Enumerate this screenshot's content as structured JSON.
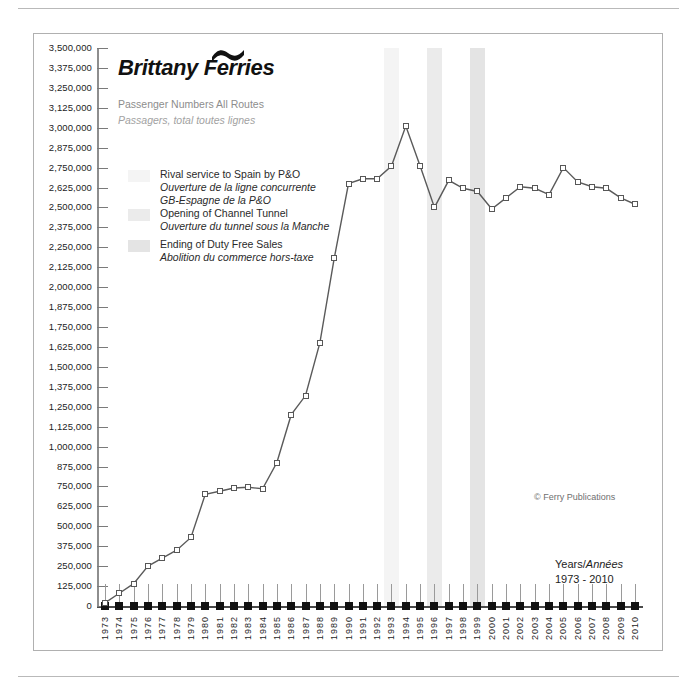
{
  "brand": {
    "name_part1": "Brittany",
    "name_part2": "Ferries",
    "wave_icon": "wave-icon",
    "subtitle_en": "Passenger Numbers All Routes",
    "subtitle_fr": "Passagers, total toutes lignes"
  },
  "legend": [
    {
      "swatch_color": "#f4f4f4",
      "label_en": "Rival service to Spain by P&O",
      "label_fr_1": "Ouverture de la ligne concurrente",
      "label_fr_2": "GB-Espagne de la P&O"
    },
    {
      "swatch_color": "#ebebeb",
      "label_en": "Opening of Channel Tunnel",
      "label_fr_1": "Ouverture du tunnel sous la Manche",
      "label_fr_2": ""
    },
    {
      "swatch_color": "#e4e4e4",
      "label_en": "Ending of Duty Free Sales",
      "label_fr_1": "Abolition du commerce hors-taxe",
      "label_fr_2": ""
    }
  ],
  "footer": {
    "copyright": "© Ferry Publications",
    "years_label_en": "Years/",
    "years_label_fr": "Années",
    "years_range": "1973 - 2010"
  },
  "chart_data": {
    "type": "line",
    "title": "Passenger Numbers All Routes",
    "subtitle": "Passagers, total toutes lignes",
    "xlabel": "Years/Années 1973 - 2010",
    "ylabel": "",
    "ylim": [
      0,
      3500000
    ],
    "ytick_step": 125000,
    "grid": false,
    "legend_position": "upper-left",
    "ytick_labels": [
      "3,500,000",
      "3,375,000",
      "3,250,000",
      "3,125,000",
      "3,000,000",
      "2,875,000",
      "2,750,000",
      "2,625,000",
      "2,500,000",
      "2,375,000",
      "2,250,000",
      "2,125,000",
      "2,000,000",
      "1,875,000",
      "1,750,000",
      "1,625,000",
      "1,500,000",
      "1,375,000",
      "1,250,000",
      "1,125,000",
      "1,000,000",
      "875,000",
      "750,000",
      "625,000",
      "500,000",
      "375,000",
      "250,000",
      "125,000",
      "0"
    ],
    "categories": [
      "1973",
      "1974",
      "1975",
      "1976",
      "1977",
      "1978",
      "1979",
      "1980",
      "1981",
      "1982",
      "1983",
      "1984",
      "1985",
      "1986",
      "1987",
      "1988",
      "1989",
      "1990",
      "1991",
      "1992",
      "1993",
      "1994",
      "1995",
      "1996",
      "1997",
      "1998",
      "1999",
      "2000",
      "2001",
      "2002",
      "2003",
      "2004",
      "2005",
      "2006",
      "2007",
      "2008",
      "2009",
      "2010"
    ],
    "series": [
      {
        "name": "Passenger Numbers All Routes",
        "values": [
          20000,
          80000,
          140000,
          250000,
          300000,
          350000,
          430000,
          700000,
          720000,
          740000,
          745000,
          735000,
          900000,
          1200000,
          1320000,
          1650000,
          2180000,
          2650000,
          2680000,
          2680000,
          2760000,
          3010000,
          2760000,
          2500000,
          2670000,
          2620000,
          2600000,
          2490000,
          2560000,
          2630000,
          2620000,
          2580000,
          2750000,
          2660000,
          2630000,
          2620000,
          2560000,
          2520000
        ]
      }
    ],
    "event_bands": [
      {
        "year": "1993",
        "label": "Rival service to Spain by P&O",
        "color": "#f4f4f4"
      },
      {
        "year": "1996",
        "label": "Opening of Channel Tunnel",
        "color": "#ebebeb"
      },
      {
        "year": "1999",
        "label": "Ending of Duty Free Sales",
        "color": "#e4e4e4"
      }
    ]
  }
}
